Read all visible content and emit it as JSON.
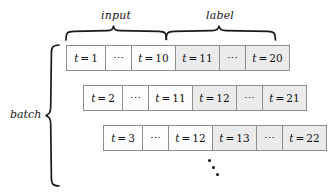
{
  "figure": {
    "caption_groups": {
      "input": "input",
      "label": "label"
    },
    "batch_label": "batch",
    "ellipsis_cell": "⋯",
    "vertical_ellipsis": "⋮",
    "colors": {
      "cell_border": "#8e8e8e",
      "input_fill": "#fdfdfd",
      "label_fill": "#ebebeb",
      "text": "#111111",
      "brace": "#1a1a1a"
    }
  },
  "rows": [
    {
      "name": "batch-row-1",
      "left": 66,
      "top": 45,
      "cells": [
        {
          "text": "t = 1",
          "var": "t",
          "eq": "=",
          "num": "1",
          "segment": "input",
          "width": 40,
          "kind": "value"
        },
        {
          "text": "⋯",
          "segment": "input",
          "width": 27,
          "kind": "ellipsis"
        },
        {
          "text": "t = 10",
          "var": "t",
          "eq": "=",
          "num": "10",
          "segment": "input",
          "width": 45,
          "kind": "value"
        },
        {
          "text": "t = 11",
          "var": "t",
          "eq": "=",
          "num": "11",
          "segment": "label",
          "width": 45,
          "kind": "value"
        },
        {
          "text": "⋯",
          "segment": "label",
          "width": 27,
          "kind": "ellipsis"
        },
        {
          "text": "t = 20",
          "var": "t",
          "eq": "=",
          "num": "20",
          "segment": "label",
          "width": 45,
          "kind": "value"
        }
      ]
    },
    {
      "name": "batch-row-2",
      "left": 83,
      "top": 85,
      "cells": [
        {
          "text": "t = 2",
          "var": "t",
          "eq": "=",
          "num": "2",
          "segment": "input",
          "width": 40,
          "kind": "value"
        },
        {
          "text": "⋯",
          "segment": "input",
          "width": 27,
          "kind": "ellipsis"
        },
        {
          "text": "t = 11",
          "var": "t",
          "eq": "=",
          "num": "11",
          "segment": "input",
          "width": 45,
          "kind": "value"
        },
        {
          "text": "t = 12",
          "var": "t",
          "eq": "=",
          "num": "12",
          "segment": "label",
          "width": 45,
          "kind": "value"
        },
        {
          "text": "⋯",
          "segment": "label",
          "width": 27,
          "kind": "ellipsis"
        },
        {
          "text": "t = 21",
          "var": "t",
          "eq": "=",
          "num": "21",
          "segment": "label",
          "width": 45,
          "kind": "value"
        }
      ]
    },
    {
      "name": "batch-row-3",
      "left": 103,
      "top": 125,
      "cells": [
        {
          "text": "t = 3",
          "var": "t",
          "eq": "=",
          "num": "3",
          "segment": "input",
          "width": 40,
          "kind": "value"
        },
        {
          "text": "⋯",
          "segment": "input",
          "width": 27,
          "kind": "ellipsis"
        },
        {
          "text": "t = 12",
          "var": "t",
          "eq": "=",
          "num": "12",
          "segment": "input",
          "width": 45,
          "kind": "value"
        },
        {
          "text": "t = 13",
          "var": "t",
          "eq": "=",
          "num": "13",
          "segment": "label",
          "width": 45,
          "kind": "value"
        },
        {
          "text": "⋯",
          "segment": "label",
          "width": 27,
          "kind": "ellipsis"
        },
        {
          "text": "t = 22",
          "var": "t",
          "eq": "=",
          "num": "22",
          "segment": "label",
          "width": 45,
          "kind": "value"
        }
      ]
    }
  ]
}
